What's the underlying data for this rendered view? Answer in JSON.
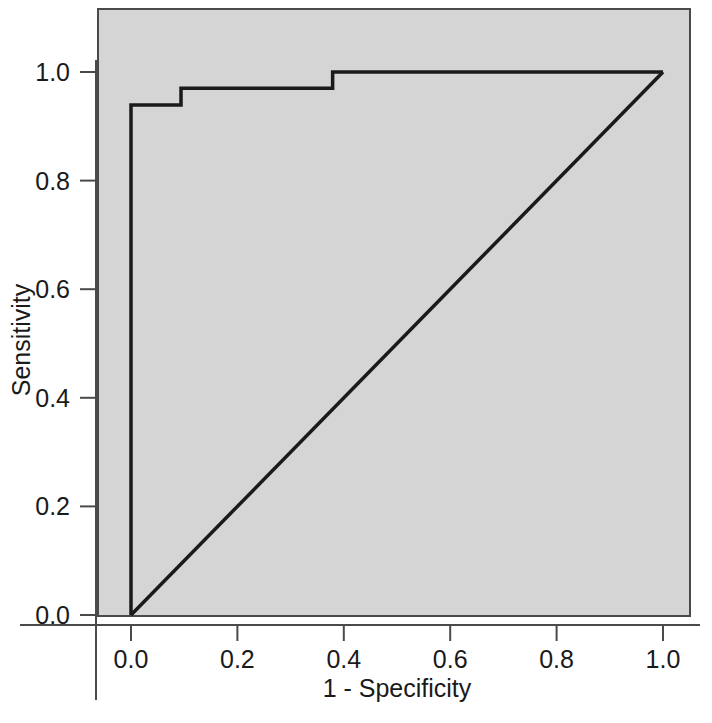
{
  "chart_data": {
    "type": "line",
    "title": "",
    "subtitle": "",
    "xlabel": "1 - Specificity",
    "ylabel": "Sensitivity",
    "xlim": [
      0.0,
      1.0
    ],
    "ylim": [
      0.0,
      1.0
    ],
    "xticks": [
      "0.0",
      "0.2",
      "0.4",
      "0.6",
      "0.8",
      "1.0"
    ],
    "xtick_values": [
      0.0,
      0.2,
      0.4,
      0.6,
      0.8,
      1.0
    ],
    "yticks": [
      "0.0",
      "0.2",
      "0.4",
      "0.6",
      "0.8",
      "1.0"
    ],
    "ytick_values": [
      0.0,
      0.2,
      0.4,
      0.6,
      0.8,
      1.0
    ],
    "grid": false,
    "legend": "none",
    "panel_background": "#d5d5d5",
    "line_color": "#1a1a1a",
    "series": [
      {
        "name": "ROC curve",
        "style": "step",
        "x": [
          0.0,
          0.0,
          0.094,
          0.094,
          0.379,
          0.379,
          1.0
        ],
        "y": [
          0.0,
          0.939,
          0.939,
          0.97,
          0.97,
          1.0,
          1.0
        ]
      },
      {
        "name": "Chance diagonal",
        "style": "line",
        "x": [
          0.0,
          1.0
        ],
        "y": [
          0.0,
          1.0
        ]
      }
    ]
  },
  "axes": {
    "x_title": "1 - Specificity",
    "y_title": "Sensitivity"
  }
}
